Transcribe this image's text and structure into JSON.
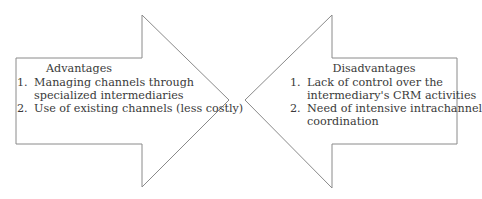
{
  "diagram": {
    "stroke_color": "#8a8a8a",
    "background": "#ffffff",
    "left_arrow": {
      "direction": "right",
      "title": "Advantages",
      "items": [
        {
          "num": "1.",
          "text": "Managing channels through specialized intermediaries",
          "lines": [
            "Managing channels through",
            "specialized intermediaries"
          ]
        },
        {
          "num": "2.",
          "text": "Use of existing channels (less costly)",
          "lines": [
            "Use of existing channels (less costly)"
          ]
        }
      ]
    },
    "right_arrow": {
      "direction": "left",
      "title": "Disadvantages",
      "items": [
        {
          "num": "1.",
          "text": "Lack of control over the intermediary's CRM activities",
          "lines": [
            "Lack of control over the",
            "intermediary's CRM activities"
          ]
        },
        {
          "num": "2.",
          "text": "Need of intensive intrachannel coordination",
          "lines": [
            "Need of intensive intrachannel",
            "coordination"
          ]
        }
      ]
    }
  }
}
